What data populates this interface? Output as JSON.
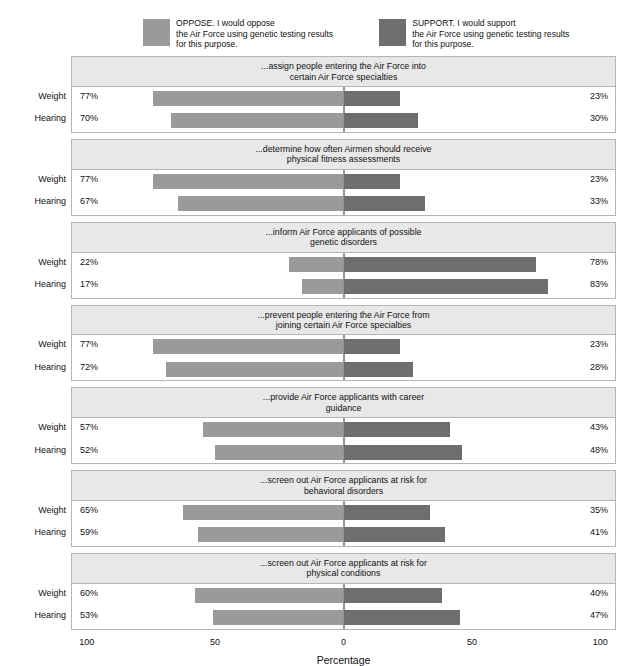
{
  "legend": {
    "oppose": {
      "label": "OPPOSE. I would oppose\nthe Air Force using genetic testing results\nfor this purpose.",
      "color": "#9a9a9a"
    },
    "support": {
      "label": "SUPPORT. I would support\nthe Air Force using genetic testing results\nfor this purpose.",
      "color": "#6e6e6e"
    }
  },
  "axis": {
    "title": "Percentage",
    "ticks": [
      "100",
      "50",
      "0",
      "50",
      "100"
    ],
    "tick_positions": [
      -100,
      -50,
      0,
      50,
      100
    ],
    "min": -110,
    "max": 110
  },
  "row_labels": {
    "weight": "Weight",
    "hearing": "Hearing"
  },
  "chart_data": {
    "type": "bar",
    "title": "",
    "subtitle": "",
    "xlabel": "Percentage",
    "ylabel": "",
    "xlim": [
      -110,
      110
    ],
    "grid": false,
    "legend_position": "top",
    "orientation": "horizontal-diverging",
    "categories": [
      "Weight",
      "Hearing"
    ],
    "series": [
      {
        "name": "OPPOSE. I would oppose the Air Force using genetic testing results for this purpose.",
        "color": "#9a9a9a"
      },
      {
        "name": "SUPPORT. I would support the Air Force using genetic testing results for this purpose.",
        "color": "#6e6e6e"
      }
    ],
    "panels": [
      {
        "title": "...assign people entering the Air Force into\ncertain Air Force specialties",
        "rows": [
          {
            "label": "Weight",
            "oppose": 77,
            "support": 23,
            "oppose_text": "77%",
            "support_text": "23%"
          },
          {
            "label": "Hearing",
            "oppose": 70,
            "support": 30,
            "oppose_text": "70%",
            "support_text": "30%"
          }
        ]
      },
      {
        "title": "...determine how often Airmen should receive\nphysical fitness assessments",
        "rows": [
          {
            "label": "Weight",
            "oppose": 77,
            "support": 23,
            "oppose_text": "77%",
            "support_text": "23%"
          },
          {
            "label": "Hearing",
            "oppose": 67,
            "support": 33,
            "oppose_text": "67%",
            "support_text": "33%"
          }
        ]
      },
      {
        "title": "...inform Air Force applicants of possible\ngenetic disorders",
        "rows": [
          {
            "label": "Weight",
            "oppose": 22,
            "support": 78,
            "oppose_text": "22%",
            "support_text": "78%"
          },
          {
            "label": "Hearing",
            "oppose": 17,
            "support": 83,
            "oppose_text": "17%",
            "support_text": "83%"
          }
        ]
      },
      {
        "title": "...prevent people entering the Air Force from\njoining certain Air Force specialties",
        "rows": [
          {
            "label": "Weight",
            "oppose": 77,
            "support": 23,
            "oppose_text": "77%",
            "support_text": "23%"
          },
          {
            "label": "Hearing",
            "oppose": 72,
            "support": 28,
            "oppose_text": "72%",
            "support_text": "28%"
          }
        ]
      },
      {
        "title": "...provide Air Force applicants with career\nguidance",
        "rows": [
          {
            "label": "Weight",
            "oppose": 57,
            "support": 43,
            "oppose_text": "57%",
            "support_text": "43%"
          },
          {
            "label": "Hearing",
            "oppose": 52,
            "support": 48,
            "oppose_text": "52%",
            "support_text": "48%"
          }
        ]
      },
      {
        "title": "...screen out Air Force applicants at risk for\nbehavioral disorders",
        "rows": [
          {
            "label": "Weight",
            "oppose": 65,
            "support": 35,
            "oppose_text": "65%",
            "support_text": "35%"
          },
          {
            "label": "Hearing",
            "oppose": 59,
            "support": 41,
            "oppose_text": "59%",
            "support_text": "41%"
          }
        ]
      },
      {
        "title": "...screen out Air Force applicants at risk for\nphysical conditions",
        "rows": [
          {
            "label": "Weight",
            "oppose": 60,
            "support": 40,
            "oppose_text": "60%",
            "support_text": "40%"
          },
          {
            "label": "Hearing",
            "oppose": 53,
            "support": 47,
            "oppose_text": "53%",
            "support_text": "47%"
          }
        ]
      }
    ]
  }
}
